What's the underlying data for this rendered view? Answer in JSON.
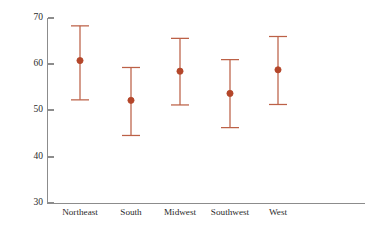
{
  "chart_data": {
    "type": "scatter",
    "title": "",
    "subtitle": "",
    "xlabel": "",
    "ylabel": "",
    "categories": [
      "Northeast",
      "South",
      "Midwest",
      "Southwest",
      "West"
    ],
    "values": [
      60.8,
      52.2,
      58.5,
      53.7,
      58.8
    ],
    "error_low": [
      52.3,
      44.6,
      51.2,
      46.3,
      51.3
    ],
    "error_high": [
      68.3,
      59.3,
      65.6,
      61.0,
      66.0
    ],
    "series": [
      {
        "name": "mean with confidence interval",
        "values": [
          60.8,
          52.2,
          58.5,
          53.7,
          58.8
        ],
        "error_low": [
          52.3,
          44.6,
          51.2,
          46.3,
          51.3
        ],
        "error_high": [
          68.3,
          59.3,
          65.6,
          61.0,
          66.0
        ]
      }
    ],
    "points": [
      {
        "category": "Northeast",
        "mean": 60.8,
        "lower": 52.3,
        "upper": 68.3
      },
      {
        "category": "South",
        "mean": 52.2,
        "lower": 44.6,
        "upper": 59.3
      },
      {
        "category": "Midwest",
        "mean": 58.5,
        "lower": 51.2,
        "upper": 65.6
      },
      {
        "category": "Southwest",
        "mean": 53.7,
        "lower": 46.3,
        "upper": 61.0
      },
      {
        "category": "West",
        "mean": 58.8,
        "lower": 51.3,
        "upper": 66.0
      }
    ],
    "ylim": [
      30,
      70
    ],
    "yticks": [
      30,
      40,
      50,
      60,
      70
    ],
    "ytick_labels": [
      "30",
      "40",
      "50",
      "60",
      "70"
    ],
    "xlim_categories": 5,
    "grid": false,
    "legend": false,
    "legend_position": "none",
    "annotations": [],
    "colors": {
      "marker": "#B4462A",
      "whisker": "#BC6147",
      "axis": "#8C8C8C",
      "text": "#2B2B2B",
      "background": "#FFFFFF"
    }
  },
  "axes": {
    "y_tick_0": "70",
    "y_tick_1": "60",
    "y_tick_2": "50",
    "y_tick_3": "40",
    "y_tick_4": "30"
  },
  "categories": {
    "c0": "Northeast",
    "c1": "South",
    "c2": "Midwest",
    "c3": "Southwest",
    "c4": "West"
  }
}
